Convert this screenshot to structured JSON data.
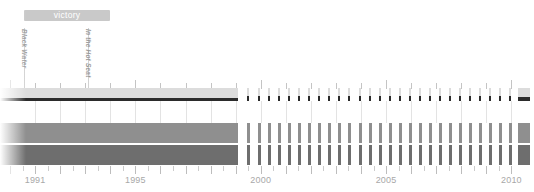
{
  "chart_data": {
    "type": "bar",
    "title": "",
    "xlabel": "",
    "ylabel": "",
    "xlim": [
      1989.6,
      2010.9
    ],
    "grid": true,
    "legend_position": "none",
    "axis": {
      "tick_labels": [
        "1991",
        "1995",
        "2000",
        "2005",
        "2010"
      ],
      "tick_values": [
        1991,
        1995,
        2000,
        2005,
        2010
      ],
      "minor_tick_step": 0.5
    },
    "series": [
      {
        "name": "row-1",
        "color": "#dcdcdc",
        "baseline_color": "#2b2b2b",
        "continuous_span": [
          1989.6,
          1999.1
        ],
        "values": [
          1999.45,
          1999.9,
          2000.3,
          2000.7,
          2001.1,
          2001.5,
          2001.9,
          2002.3,
          2002.7,
          2003.1,
          2003.5,
          2003.9,
          2004.3,
          2004.7,
          2005.1,
          2005.5,
          2005.9,
          2006.3,
          2006.7,
          2007.1,
          2007.5,
          2007.9,
          2008.3,
          2008.7,
          2009.1,
          2009.5,
          2009.9
        ],
        "end_block": [
          2010.25,
          2010.75
        ]
      },
      {
        "name": "row-2",
        "color": "#8f8f8f",
        "continuous_span": [
          1989.6,
          1999.1
        ],
        "values": [
          1999.45,
          1999.9,
          2000.3,
          2000.7,
          2001.1,
          2001.5,
          2001.9,
          2002.3,
          2002.7,
          2003.1,
          2003.5,
          2003.9,
          2004.3,
          2004.7,
          2005.1,
          2005.5,
          2005.9,
          2006.3,
          2006.7,
          2007.1,
          2007.5,
          2007.9,
          2008.3,
          2008.7,
          2009.1,
          2009.5,
          2009.9
        ],
        "end_block": [
          2010.25,
          2010.75
        ]
      },
      {
        "name": "row-3",
        "color": "#6e6e6e",
        "continuous_span": [
          1989.6,
          1999.1
        ],
        "values": [
          1999.45,
          1999.9,
          2000.3,
          2000.7,
          2001.1,
          2001.5,
          2001.9,
          2002.3,
          2002.7,
          2003.1,
          2003.5,
          2003.9,
          2004.3,
          2004.7,
          2005.1,
          2005.5,
          2005.9,
          2006.3,
          2006.7,
          2007.1,
          2007.5,
          2007.9,
          2008.3,
          2008.7,
          2009.1,
          2009.5,
          2009.9
        ],
        "end_block": [
          2010.25,
          2010.75
        ]
      }
    ],
    "annotations": {
      "span_bar": {
        "label": "victory",
        "start": 1990.55,
        "end": 1994.0,
        "color": "#c9c9c9",
        "text_color": "#ffffff"
      },
      "markers": [
        {
          "label": "Black Water",
          "at": 1990.55
        },
        {
          "label": "In the Hot Seat",
          "at": 1993.1
        }
      ]
    }
  },
  "colors": {
    "row1_band": "#dcdcdc",
    "row1_baseline": "#2b2b2b",
    "row2": "#8f8f8f",
    "row3": "#6e6e6e",
    "axis_text": "#a8a8a8",
    "annotation_bar": "#c9c9c9",
    "annotation_text": "#9a9a9a",
    "background": "#ffffff"
  }
}
